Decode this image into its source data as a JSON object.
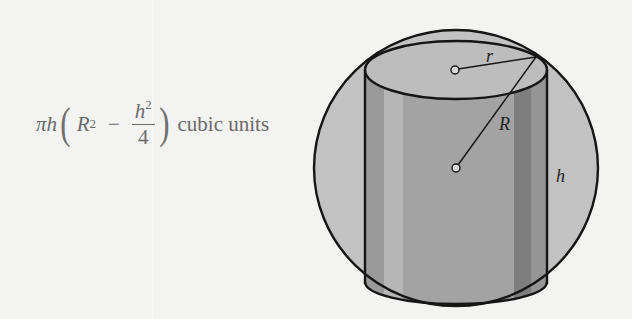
{
  "formula": {
    "pi": "π",
    "h": "h",
    "R": "R",
    "R_exp": "2",
    "minus": "−",
    "frac_num": "h",
    "frac_num_exp": "2",
    "frac_den": "4",
    "units": "cubic units"
  },
  "diagram": {
    "labels": {
      "r": "r",
      "R": "R",
      "h": "h"
    },
    "colors": {
      "background": "#f3f3f2",
      "sphere_fill": "#c2c2c2",
      "cylinder_body": "#a2a2a2",
      "cylinder_light_band": "#b8b8b8",
      "cylinder_dark_band": "#7e7e7e",
      "cylinder_top": "#bdbdbd",
      "stroke": "#151515"
    }
  }
}
